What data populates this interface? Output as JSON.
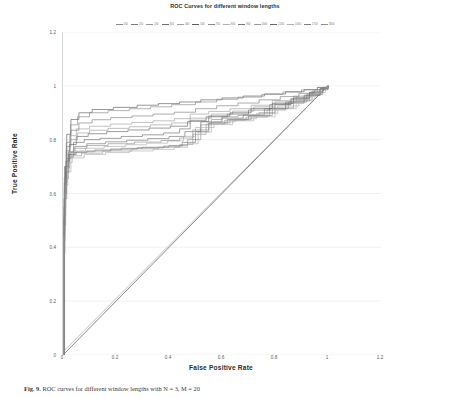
{
  "chart_data": {
    "type": "line",
    "title": "ROC Curves for different window lengths",
    "xlabel": "False Positive Rate",
    "ylabel": "True Positive Rate",
    "xlim": [
      0,
      1.2
    ],
    "ylim": [
      0,
      1.2
    ],
    "xticks": [
      "0",
      "0.2",
      "0.4",
      "0.6",
      "0.8",
      "1",
      "1.2"
    ],
    "yticks": [
      "0",
      "0.2",
      "0.4",
      "0.6",
      "0.8",
      "1",
      "1.2"
    ],
    "xtick_values": [
      0,
      0.2,
      0.4,
      0.6,
      0.8,
      1,
      1.2
    ],
    "ytick_values": [
      0,
      0.2,
      0.4,
      0.6,
      0.8,
      1,
      1.2
    ],
    "grid": true,
    "legend_position": "top",
    "legend_title": "",
    "series": [
      {
        "name": "100",
        "color": "#8c8c8c",
        "points": [
          [
            0,
            0
          ],
          [
            0.004,
            0.46
          ],
          [
            0.008,
            0.62
          ],
          [
            0.012,
            0.7
          ],
          [
            0.02,
            0.745
          ],
          [
            0.05,
            0.755
          ],
          [
            0.12,
            0.762
          ],
          [
            0.22,
            0.768
          ],
          [
            0.3,
            0.772
          ],
          [
            0.4,
            0.778
          ],
          [
            0.47,
            0.8
          ],
          [
            0.52,
            0.855
          ],
          [
            0.56,
            0.875
          ],
          [
            0.6,
            0.885
          ],
          [
            0.66,
            0.89
          ],
          [
            0.74,
            0.9
          ],
          [
            0.8,
            0.93
          ],
          [
            0.86,
            0.95
          ],
          [
            0.92,
            0.97
          ],
          [
            0.97,
            0.99
          ],
          [
            1,
            1
          ]
        ]
      },
      {
        "name": "150",
        "color": "#7a7a7a",
        "points": [
          [
            0,
            0
          ],
          [
            0.004,
            0.5
          ],
          [
            0.008,
            0.66
          ],
          [
            0.014,
            0.73
          ],
          [
            0.03,
            0.752
          ],
          [
            0.09,
            0.758
          ],
          [
            0.18,
            0.765
          ],
          [
            0.28,
            0.77
          ],
          [
            0.38,
            0.776
          ],
          [
            0.45,
            0.79
          ],
          [
            0.5,
            0.83
          ],
          [
            0.55,
            0.862
          ],
          [
            0.62,
            0.875
          ],
          [
            0.7,
            0.888
          ],
          [
            0.78,
            0.915
          ],
          [
            0.85,
            0.94
          ],
          [
            0.92,
            0.965
          ],
          [
            0.97,
            0.988
          ],
          [
            1,
            1
          ]
        ]
      },
      {
        "name": "200",
        "color": "#999999",
        "points": [
          [
            0,
            0
          ],
          [
            0.003,
            0.42
          ],
          [
            0.007,
            0.6
          ],
          [
            0.012,
            0.695
          ],
          [
            0.025,
            0.74
          ],
          [
            0.07,
            0.75
          ],
          [
            0.15,
            0.758
          ],
          [
            0.26,
            0.766
          ],
          [
            0.36,
            0.772
          ],
          [
            0.44,
            0.782
          ],
          [
            0.49,
            0.82
          ],
          [
            0.54,
            0.858
          ],
          [
            0.61,
            0.872
          ],
          [
            0.69,
            0.884
          ],
          [
            0.77,
            0.91
          ],
          [
            0.84,
            0.935
          ],
          [
            0.91,
            0.962
          ],
          [
            0.96,
            0.985
          ],
          [
            1,
            1
          ]
        ]
      },
      {
        "name": "300",
        "color": "#6e6e6e",
        "points": [
          [
            0,
            0
          ],
          [
            0.004,
            0.55
          ],
          [
            0.01,
            0.7
          ],
          [
            0.02,
            0.755
          ],
          [
            0.04,
            0.79
          ],
          [
            0.08,
            0.8
          ],
          [
            0.14,
            0.805
          ],
          [
            0.22,
            0.812
          ],
          [
            0.3,
            0.818
          ],
          [
            0.38,
            0.825
          ],
          [
            0.44,
            0.84
          ],
          [
            0.48,
            0.872
          ],
          [
            0.54,
            0.885
          ],
          [
            0.62,
            0.895
          ],
          [
            0.7,
            0.91
          ],
          [
            0.78,
            0.93
          ],
          [
            0.86,
            0.952
          ],
          [
            0.93,
            0.975
          ],
          [
            0.98,
            0.993
          ],
          [
            1,
            1
          ]
        ]
      },
      {
        "name": "400",
        "color": "#a0a0a0",
        "points": [
          [
            0,
            0
          ],
          [
            0.005,
            0.62
          ],
          [
            0.012,
            0.76
          ],
          [
            0.025,
            0.815
          ],
          [
            0.05,
            0.84
          ],
          [
            0.1,
            0.85
          ],
          [
            0.18,
            0.858
          ],
          [
            0.26,
            0.864
          ],
          [
            0.34,
            0.87
          ],
          [
            0.42,
            0.878
          ],
          [
            0.48,
            0.895
          ],
          [
            0.55,
            0.905
          ],
          [
            0.63,
            0.915
          ],
          [
            0.71,
            0.928
          ],
          [
            0.79,
            0.945
          ],
          [
            0.87,
            0.962
          ],
          [
            0.94,
            0.98
          ],
          [
            0.98,
            0.994
          ],
          [
            1,
            1
          ]
        ]
      },
      {
        "name": "500",
        "color": "#5f5f5f",
        "points": [
          [
            0,
            0
          ],
          [
            0.006,
            0.7
          ],
          [
            0.014,
            0.82
          ],
          [
            0.03,
            0.875
          ],
          [
            0.06,
            0.9
          ],
          [
            0.11,
            0.912
          ],
          [
            0.19,
            0.92
          ],
          [
            0.28,
            0.928
          ],
          [
            0.36,
            0.934
          ],
          [
            0.44,
            0.94
          ],
          [
            0.52,
            0.948
          ],
          [
            0.6,
            0.955
          ],
          [
            0.68,
            0.962
          ],
          [
            0.76,
            0.97
          ],
          [
            0.84,
            0.978
          ],
          [
            0.91,
            0.986
          ],
          [
            0.96,
            0.994
          ],
          [
            1,
            1
          ]
        ]
      },
      {
        "name": "750",
        "color": "#8a8a8a",
        "points": [
          [
            0,
            0
          ],
          [
            0.005,
            0.66
          ],
          [
            0.012,
            0.79
          ],
          [
            0.028,
            0.855
          ],
          [
            0.055,
            0.885
          ],
          [
            0.1,
            0.9
          ],
          [
            0.17,
            0.908
          ],
          [
            0.25,
            0.915
          ],
          [
            0.33,
            0.922
          ],
          [
            0.41,
            0.93
          ],
          [
            0.5,
            0.94
          ],
          [
            0.58,
            0.95
          ],
          [
            0.66,
            0.958
          ],
          [
            0.75,
            0.968
          ],
          [
            0.83,
            0.977
          ],
          [
            0.9,
            0.985
          ],
          [
            0.96,
            0.994
          ],
          [
            1,
            1
          ]
        ]
      },
      {
        "name": "800",
        "color": "#b0b0b0",
        "points": [
          [
            0,
            0
          ],
          [
            0.003,
            0.38
          ],
          [
            0.008,
            0.58
          ],
          [
            0.015,
            0.68
          ],
          [
            0.03,
            0.732
          ],
          [
            0.08,
            0.745
          ],
          [
            0.16,
            0.752
          ],
          [
            0.25,
            0.758
          ],
          [
            0.34,
            0.764
          ],
          [
            0.42,
            0.772
          ],
          [
            0.47,
            0.785
          ],
          [
            0.51,
            0.828
          ],
          [
            0.56,
            0.856
          ],
          [
            0.64,
            0.87
          ],
          [
            0.72,
            0.885
          ],
          [
            0.8,
            0.915
          ],
          [
            0.88,
            0.945
          ],
          [
            0.94,
            0.972
          ],
          [
            0.98,
            0.99
          ],
          [
            1,
            1
          ]
        ]
      },
      {
        "name": "900",
        "color": "#757575",
        "points": [
          [
            0,
            0
          ],
          [
            0.004,
            0.52
          ],
          [
            0.01,
            0.68
          ],
          [
            0.022,
            0.745
          ],
          [
            0.045,
            0.775
          ],
          [
            0.09,
            0.785
          ],
          [
            0.16,
            0.792
          ],
          [
            0.24,
            0.798
          ],
          [
            0.32,
            0.804
          ],
          [
            0.4,
            0.812
          ],
          [
            0.46,
            0.83
          ],
          [
            0.52,
            0.866
          ],
          [
            0.6,
            0.88
          ],
          [
            0.68,
            0.892
          ],
          [
            0.76,
            0.915
          ],
          [
            0.84,
            0.94
          ],
          [
            0.91,
            0.965
          ],
          [
            0.97,
            0.99
          ],
          [
            1,
            1
          ]
        ]
      },
      {
        "name": "1000",
        "color": "#9a9a9a",
        "points": [
          [
            0,
            0
          ],
          [
            0.005,
            0.6
          ],
          [
            0.013,
            0.745
          ],
          [
            0.028,
            0.8
          ],
          [
            0.055,
            0.825
          ],
          [
            0.1,
            0.835
          ],
          [
            0.17,
            0.842
          ],
          [
            0.25,
            0.848
          ],
          [
            0.33,
            0.855
          ],
          [
            0.41,
            0.862
          ],
          [
            0.48,
            0.88
          ],
          [
            0.56,
            0.895
          ],
          [
            0.64,
            0.906
          ],
          [
            0.72,
            0.922
          ],
          [
            0.8,
            0.94
          ],
          [
            0.88,
            0.958
          ],
          [
            0.94,
            0.978
          ],
          [
            0.98,
            0.993
          ],
          [
            1,
            1
          ]
        ]
      },
      {
        "name": "1200",
        "color": "#686868",
        "points": [
          [
            0,
            0
          ],
          [
            0.004,
            0.58
          ],
          [
            0.011,
            0.72
          ],
          [
            0.024,
            0.782
          ],
          [
            0.05,
            0.812
          ],
          [
            0.095,
            0.822
          ],
          [
            0.165,
            0.83
          ],
          [
            0.245,
            0.836
          ],
          [
            0.325,
            0.843
          ],
          [
            0.405,
            0.85
          ],
          [
            0.47,
            0.868
          ],
          [
            0.55,
            0.888
          ],
          [
            0.63,
            0.9
          ],
          [
            0.71,
            0.916
          ],
          [
            0.79,
            0.935
          ],
          [
            0.87,
            0.955
          ],
          [
            0.93,
            0.976
          ],
          [
            0.98,
            0.992
          ],
          [
            1,
            1
          ]
        ]
      },
      {
        "name": "1400",
        "color": "#adadad",
        "points": [
          [
            0,
            0
          ],
          [
            0.003,
            0.44
          ],
          [
            0.009,
            0.63
          ],
          [
            0.018,
            0.715
          ],
          [
            0.035,
            0.758
          ],
          [
            0.085,
            0.768
          ],
          [
            0.155,
            0.775
          ],
          [
            0.235,
            0.781
          ],
          [
            0.315,
            0.787
          ],
          [
            0.395,
            0.795
          ],
          [
            0.455,
            0.812
          ],
          [
            0.5,
            0.845
          ],
          [
            0.57,
            0.866
          ],
          [
            0.65,
            0.878
          ],
          [
            0.73,
            0.898
          ],
          [
            0.81,
            0.925
          ],
          [
            0.89,
            0.95
          ],
          [
            0.95,
            0.975
          ],
          [
            0.99,
            0.994
          ],
          [
            1,
            1
          ]
        ]
      },
      {
        "name": "1700",
        "color": "#808080",
        "points": [
          [
            0,
            0
          ],
          [
            0.005,
            0.64
          ],
          [
            0.014,
            0.775
          ],
          [
            0.03,
            0.835
          ],
          [
            0.06,
            0.862
          ],
          [
            0.11,
            0.874
          ],
          [
            0.18,
            0.882
          ],
          [
            0.26,
            0.888
          ],
          [
            0.34,
            0.895
          ],
          [
            0.42,
            0.902
          ],
          [
            0.5,
            0.915
          ],
          [
            0.58,
            0.926
          ],
          [
            0.66,
            0.936
          ],
          [
            0.74,
            0.948
          ],
          [
            0.82,
            0.96
          ],
          [
            0.89,
            0.972
          ],
          [
            0.95,
            0.986
          ],
          [
            0.99,
            0.996
          ],
          [
            1,
            1
          ]
        ]
      },
      {
        "name": "1800",
        "color": "#909090",
        "points": [
          [
            0,
            0
          ],
          [
            0.004,
            0.48
          ],
          [
            0.01,
            0.655
          ],
          [
            0.02,
            0.735
          ],
          [
            0.04,
            0.768
          ],
          [
            0.09,
            0.778
          ],
          [
            0.17,
            0.785
          ],
          [
            0.27,
            0.791
          ],
          [
            0.37,
            0.797
          ],
          [
            0.44,
            0.806
          ],
          [
            0.49,
            0.836
          ],
          [
            0.55,
            0.862
          ],
          [
            0.63,
            0.874
          ],
          [
            0.71,
            0.89
          ],
          [
            0.79,
            0.918
          ],
          [
            0.87,
            0.944
          ],
          [
            0.93,
            0.968
          ],
          [
            0.98,
            0.991
          ],
          [
            1,
            1
          ]
        ]
      }
    ],
    "reference_line": {
      "name": "chance-diagonal",
      "color": "#6b6b6b",
      "points": [
        [
          0,
          0
        ],
        [
          1,
          1
        ]
      ]
    },
    "reference_line_shadow": {
      "name": "chance-diagonal-shadow",
      "color": "#b5b5b5",
      "points": [
        [
          0,
          0.012
        ],
        [
          1,
          1.0
        ]
      ]
    }
  },
  "caption": {
    "label": "Fig. 9.",
    "text": "ROC curves for different window lengths with N = 3, M = 20"
  }
}
